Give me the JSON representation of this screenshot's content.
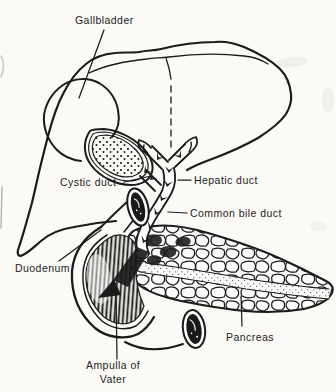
{
  "figure": {
    "type": "anatomical line diagram",
    "background_color": "#fbfaf7",
    "ink_color": "#1b1b1b"
  },
  "labels": {
    "gallbladder": "Gallbladder",
    "cystic_duct": "Cystic duct",
    "hepatic_duct": "Hepatic duct",
    "common_bile_duct": "Common bile duct",
    "duodenum": "Duodenum",
    "pancreas": "Pancreas",
    "ampulla_of_vater_line1": "Ampulla of",
    "ampulla_of_vater_line2": "Vater"
  }
}
